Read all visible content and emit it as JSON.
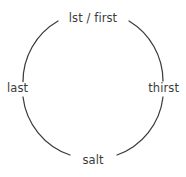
{
  "diagram": {
    "type": "cycle-ring",
    "title": "",
    "stroke_color": "#3b3b3b",
    "text_color": "#3b3b3b",
    "background_color": "#ffffff",
    "nodes": [
      {
        "id": "top",
        "label": "lst / first",
        "position": "top"
      },
      {
        "id": "right",
        "label": "thirst",
        "position": "right"
      },
      {
        "id": "bottom",
        "label": "salt",
        "position": "bottom"
      },
      {
        "id": "left",
        "label": "last",
        "position": "left"
      }
    ],
    "arcs": [
      {
        "from": "top",
        "to": "right"
      },
      {
        "from": "right",
        "to": "bottom"
      },
      {
        "from": "bottom",
        "to": "left"
      },
      {
        "from": "left",
        "to": "top"
      }
    ]
  }
}
